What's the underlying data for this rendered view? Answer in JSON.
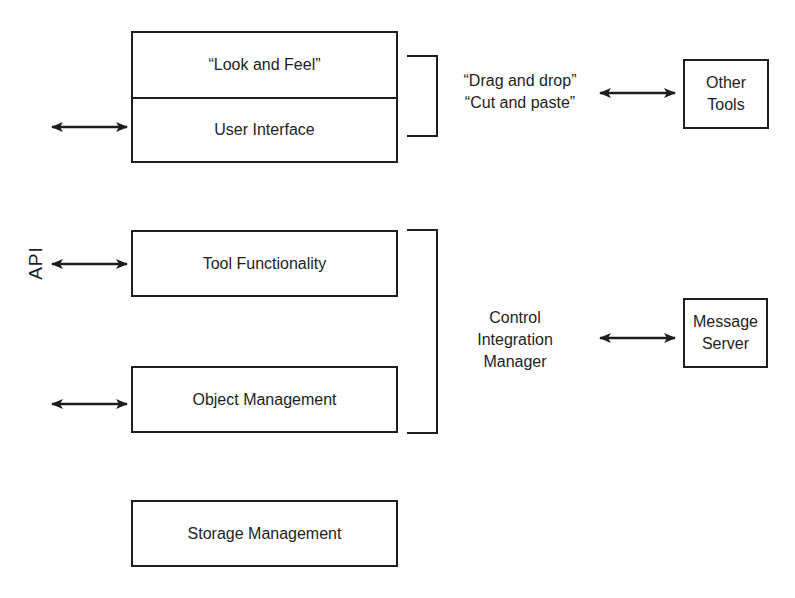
{
  "diagram": {
    "layers": {
      "look_and_feel": "“Look and Feel”",
      "user_interface": "User Interface",
      "tool_functionality": "Tool Functionality",
      "object_management": "Object Management",
      "storage_management": "Storage Management"
    },
    "api_label": "API",
    "ui_integration": {
      "line1": "“Drag and drop”",
      "line2": "“Cut and paste”"
    },
    "control_integration": {
      "line1": "Control",
      "line2": "Integration",
      "line3": "Manager"
    },
    "external": {
      "other_tools": {
        "line1": "Other",
        "line2": "Tools"
      },
      "message_server": {
        "line1": "Message",
        "line2": "Server"
      }
    },
    "colors": {
      "stroke": "#1e1e1e",
      "background": "#ffffff"
    }
  }
}
